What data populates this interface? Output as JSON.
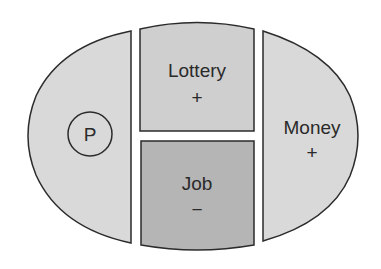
{
  "diagram": {
    "colors": {
      "light_fill": "#d9d9d9",
      "dark_fill": "#b5b5b5",
      "stroke": "#2b2b2b",
      "text": "#2a2a2a"
    },
    "left_region": {
      "circle_label": "P"
    },
    "top_center_region": {
      "label": "Lottery",
      "sign": "+"
    },
    "bottom_center_region": {
      "label": "Job",
      "sign": "−"
    },
    "right_region": {
      "label": "Money",
      "sign": "+"
    }
  }
}
